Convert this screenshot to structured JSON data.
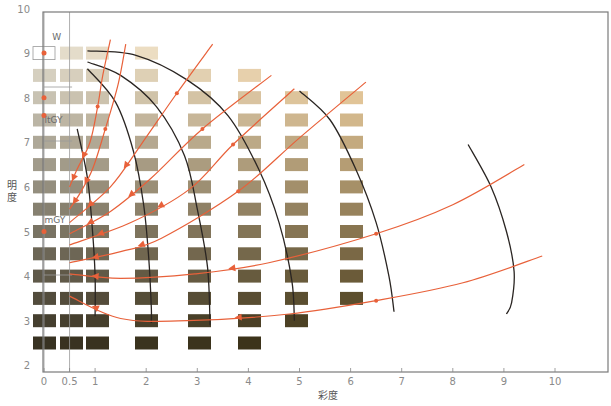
{
  "chart_data": {
    "type": "scatter",
    "title": "",
    "xlabel": "彩度",
    "ylabel": "明度",
    "xlim": [
      0,
      11
    ],
    "ylim": [
      2,
      10
    ],
    "x_ticks": [
      "0",
      "0.5",
      "1",
      "2",
      "3",
      "4",
      "5",
      "6",
      "7",
      "8",
      "9",
      "10"
    ],
    "x_tick_values": [
      0,
      0.5,
      1,
      2,
      3,
      4,
      5,
      6,
      7,
      8,
      9,
      10
    ],
    "y_ticks": [
      "2",
      "3",
      "4",
      "5",
      "6",
      "7",
      "8",
      "9",
      "10"
    ],
    "y_tick_values": [
      2,
      3,
      4,
      5,
      6,
      7,
      8,
      9,
      10
    ],
    "grid": false,
    "legend": null,
    "annotations": [
      {
        "text": "W",
        "x": 0.2,
        "y": 9.35
      },
      {
        "text": "ltGY",
        "x": 0.05,
        "y": 7.5
      },
      {
        "text": "mGY",
        "x": 0.05,
        "y": 5.25
      }
    ],
    "swatch_columns": [
      {
        "chroma": 0,
        "values": [
          9,
          8.5,
          8,
          7.5,
          7,
          6.5,
          6,
          5.5,
          5,
          4.5,
          4,
          3.5,
          3,
          2.5
        ],
        "first_is_outline": true
      },
      {
        "chroma": 0.5,
        "values": [
          9,
          8.5,
          8,
          7.5,
          7,
          6.5,
          6,
          5.5,
          5,
          4.5,
          4,
          3.5,
          3,
          2.5
        ]
      },
      {
        "chroma": 1,
        "values": [
          9,
          8.5,
          8,
          7.5,
          7,
          6.5,
          6,
          5.5,
          5,
          4.5,
          4,
          3.5,
          3,
          2.5
        ]
      },
      {
        "chroma": 2,
        "values": [
          9,
          8.5,
          8,
          7.5,
          7,
          6.5,
          6,
          5.5,
          5,
          4.5,
          4,
          3.5,
          3,
          2.5
        ]
      },
      {
        "chroma": 3,
        "values": [
          8.5,
          8,
          7.5,
          7,
          6.5,
          6,
          5.5,
          5,
          4.5,
          4,
          3.5,
          3,
          2.5
        ]
      },
      {
        "chroma": 4,
        "values": [
          8.5,
          8,
          7.5,
          7,
          6.5,
          6,
          5.5,
          5,
          4.5,
          4,
          3.5,
          3,
          2.5
        ]
      },
      {
        "chroma": 5,
        "values": [
          8,
          7.5,
          7,
          6.5,
          6,
          5.5,
          5,
          4.5,
          4,
          3.5,
          3
        ]
      },
      {
        "chroma": 6,
        "values": [
          8,
          7.5,
          7,
          6.5,
          6,
          5.5,
          5,
          4.5,
          4,
          3.5
        ]
      }
    ],
    "tone_points": [
      {
        "name": "W",
        "x": 0,
        "y": 9
      },
      {
        "name": "",
        "x": 0,
        "y": 8
      },
      {
        "name": "ltGY",
        "x": 0,
        "y": 7.6
      },
      {
        "name": "mGY",
        "x": 0,
        "y": 5
      }
    ],
    "contour_lines": [
      {
        "points": [
          [
            0.65,
            7.3
          ],
          [
            0.85,
            6.2
          ],
          [
            0.95,
            5.0
          ],
          [
            1.0,
            4.0
          ],
          [
            1.0,
            3.1
          ]
        ]
      },
      {
        "points": [
          [
            0.85,
            8.65
          ],
          [
            1.4,
            7.9
          ],
          [
            1.75,
            6.8
          ],
          [
            1.95,
            5.6
          ],
          [
            2.05,
            4.4
          ],
          [
            2.1,
            3.3
          ],
          [
            2.1,
            2.95
          ]
        ]
      },
      {
        "points": [
          [
            0.85,
            8.8
          ],
          [
            1.5,
            8.5
          ],
          [
            2.2,
            7.8
          ],
          [
            2.75,
            6.7
          ],
          [
            3.0,
            5.5
          ],
          [
            3.2,
            4.2
          ],
          [
            3.25,
            2.9
          ]
        ]
      },
      {
        "points": [
          [
            0.85,
            9.05
          ],
          [
            1.8,
            8.95
          ],
          [
            2.8,
            8.4
          ],
          [
            3.6,
            7.6
          ],
          [
            4.2,
            6.4
          ],
          [
            4.6,
            5.2
          ],
          [
            4.85,
            3.9
          ],
          [
            4.9,
            3.0
          ]
        ]
      },
      {
        "points": [
          [
            5.0,
            8.15
          ],
          [
            5.6,
            7.5
          ],
          [
            6.1,
            6.4
          ],
          [
            6.5,
            5.2
          ],
          [
            6.75,
            4.0
          ],
          [
            6.85,
            3.2
          ]
        ]
      },
      {
        "points": [
          [
            8.3,
            6.95
          ],
          [
            8.75,
            6.0
          ],
          [
            9.05,
            5.0
          ],
          [
            9.2,
            4.1
          ],
          [
            9.15,
            3.4
          ],
          [
            9.05,
            3.15
          ]
        ]
      }
    ],
    "trend_lines": [
      {
        "points": [
          [
            1.3,
            9.3
          ],
          [
            1.15,
            8.5
          ],
          [
            1.05,
            7.8
          ],
          [
            0.9,
            7.0
          ],
          [
            0.65,
            6.4
          ],
          [
            0.5,
            6.0
          ]
        ]
      },
      {
        "points": [
          [
            1.6,
            9.2
          ],
          [
            1.45,
            8.3
          ],
          [
            1.2,
            7.3
          ],
          [
            0.95,
            6.4
          ],
          [
            0.7,
            5.85
          ],
          [
            0.5,
            5.5
          ]
        ]
      },
      {
        "points": [
          [
            3.3,
            9.2
          ],
          [
            2.6,
            8.1
          ],
          [
            1.9,
            6.95
          ],
          [
            1.3,
            6.0
          ],
          [
            0.5,
            5.2
          ]
        ]
      },
      {
        "points": [
          [
            4.45,
            8.5
          ],
          [
            3.1,
            7.3
          ],
          [
            2.1,
            6.2
          ],
          [
            1.3,
            5.45
          ],
          [
            0.5,
            4.95
          ]
        ]
      },
      {
        "points": [
          [
            4.9,
            8.2
          ],
          [
            3.7,
            6.95
          ],
          [
            2.85,
            5.95
          ],
          [
            1.7,
            5.2
          ],
          [
            0.5,
            4.7
          ]
        ]
      },
      {
        "points": [
          [
            6.3,
            8.35
          ],
          [
            5.0,
            7.1
          ],
          [
            3.8,
            5.9
          ],
          [
            2.3,
            4.85
          ],
          [
            1.5,
            4.55
          ],
          [
            0.5,
            4.3
          ]
        ]
      },
      {
        "points": [
          [
            9.4,
            6.5
          ],
          [
            8.0,
            5.6
          ],
          [
            6.5,
            4.95
          ],
          [
            4.4,
            4.3
          ],
          [
            2.95,
            4.05
          ],
          [
            1.5,
            3.95
          ],
          [
            0.5,
            4.05
          ]
        ]
      },
      {
        "points": [
          [
            9.75,
            4.45
          ],
          [
            8.2,
            3.85
          ],
          [
            6.5,
            3.45
          ],
          [
            4.8,
            3.15
          ],
          [
            2.8,
            3.0
          ],
          [
            1.5,
            3.05
          ],
          [
            0.5,
            3.55
          ]
        ]
      }
    ]
  }
}
